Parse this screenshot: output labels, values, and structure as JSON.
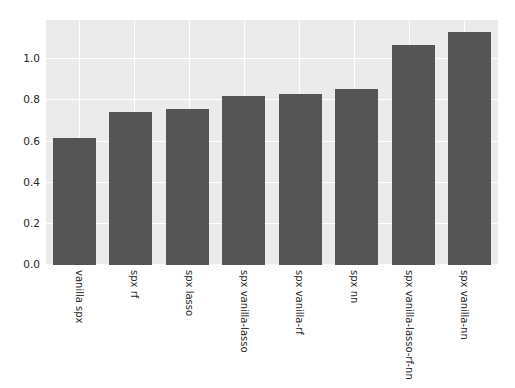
{
  "chart_data": {
    "type": "bar",
    "title": "",
    "subtitle": "",
    "xlabel": "",
    "ylabel": "",
    "categories": [
      "vanilla spx",
      "spx rf",
      "spx lasso",
      "spx vanilla-lasso",
      "spx vanilla-rf",
      "spx nn",
      "spx vanilla-lasso-rf-nn",
      "spx vanilla-nn"
    ],
    "values": [
      0.617,
      0.743,
      0.757,
      0.82,
      0.83,
      0.854,
      1.068,
      1.131
    ],
    "ylim": [
      0.0,
      1.19
    ],
    "yticks": [
      0.0,
      0.2,
      0.4,
      0.6,
      0.8,
      1.0
    ],
    "ytick_labels": [
      "0.0",
      "0.2",
      "0.4",
      "0.6",
      "0.8",
      "1.0"
    ],
    "xtick_labels": [
      "vanilla spx",
      "spx rf",
      "spx lasso",
      "spx vanilla-lasso",
      "spx vanilla-rf",
      "spx nn",
      "spx vanilla-lasso-rf-nn",
      "spx vanilla-nn"
    ],
    "grid": true,
    "legend": null,
    "legend_position": "none",
    "annotations": [],
    "colors": {
      "bar": "#555555",
      "plot_background": "#ebebeb",
      "figure_background": "#ffffff",
      "gridline": "#ffffff",
      "tick_label": "#262626"
    }
  }
}
